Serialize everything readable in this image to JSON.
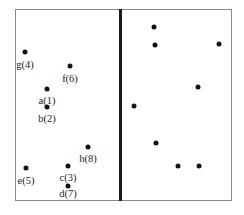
{
  "diagram": {
    "frame": {
      "left": 15,
      "top": 9,
      "right": 232,
      "bottom": 201,
      "border_color": "#8a8a8a"
    },
    "divider": {
      "x": 120,
      "color": "#1a1a1a"
    },
    "left_panel": {
      "points": [
        {
          "id": "g",
          "label": "g(4)",
          "x": 25,
          "y": 52,
          "label_y": 59
        },
        {
          "id": "f",
          "label": "f(6)",
          "x": 70,
          "y": 66,
          "label_y": 73
        },
        {
          "id": "a",
          "label": "a(1)",
          "x": 47,
          "y": 89,
          "label_y": 95
        },
        {
          "id": "b",
          "label": "b(2)",
          "x": 47,
          "y": 107,
          "label_y": 113
        },
        {
          "id": "h",
          "label": "h(8)",
          "x": 88,
          "y": 147,
          "label_y": 153
        },
        {
          "id": "e",
          "label": "e(5)",
          "x": 26,
          "y": 168,
          "label_y": 175
        },
        {
          "id": "c",
          "label": "c(3)",
          "x": 68,
          "y": 166,
          "label_y": 172
        },
        {
          "id": "d",
          "label": "d(7)",
          "x": 68,
          "y": 186,
          "label_y": 188
        }
      ]
    },
    "right_panel": {
      "points": [
        {
          "x": 154,
          "y": 27
        },
        {
          "x": 155,
          "y": 45
        },
        {
          "x": 219,
          "y": 44
        },
        {
          "x": 198,
          "y": 87
        },
        {
          "x": 134,
          "y": 106
        },
        {
          "x": 156,
          "y": 143
        },
        {
          "x": 178,
          "y": 166
        },
        {
          "x": 199,
          "y": 166
        }
      ]
    }
  }
}
